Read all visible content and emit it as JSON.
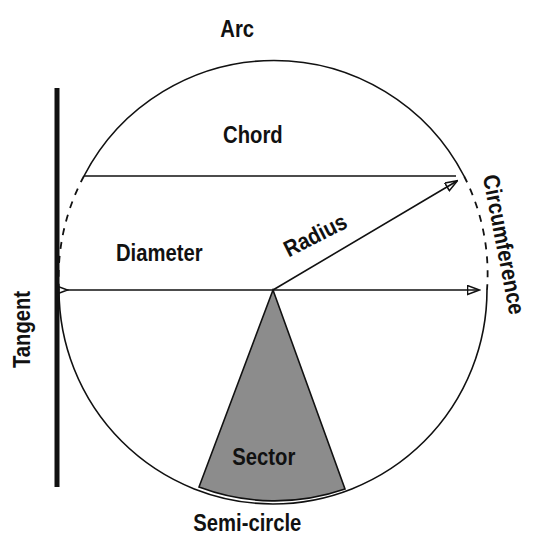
{
  "diagram": {
    "background_color": "#ffffff",
    "stroke_color": "#111111",
    "sector_fill_color": "#8c8c8c",
    "labels": {
      "arc": "Arc",
      "chord": "Chord",
      "diameter": "Diameter",
      "radius": "Radius",
      "tangent": "Tangent",
      "circumference": "Circumference",
      "sector": "Sector",
      "semicircle": "Semi-circle"
    },
    "geometry": {
      "center": {
        "x": 273,
        "y": 290
      },
      "radius": 214,
      "diameter_endpoints": [
        {
          "x": 59,
          "y": 290
        },
        {
          "x": 487,
          "y": 290
        }
      ],
      "chord_endpoints": [
        {
          "x": 84,
          "y": 176
        },
        {
          "x": 464,
          "y": 176
        }
      ],
      "radius_endpoint": {
        "x": 464,
        "y": 176
      },
      "tangent_line": {
        "x": 57,
        "y_top": 88,
        "y_bottom": 487
      },
      "sector_arc_endpoints": [
        {
          "x": 199,
          "y": 487
        },
        {
          "x": 345,
          "y": 489
        }
      ]
    }
  }
}
